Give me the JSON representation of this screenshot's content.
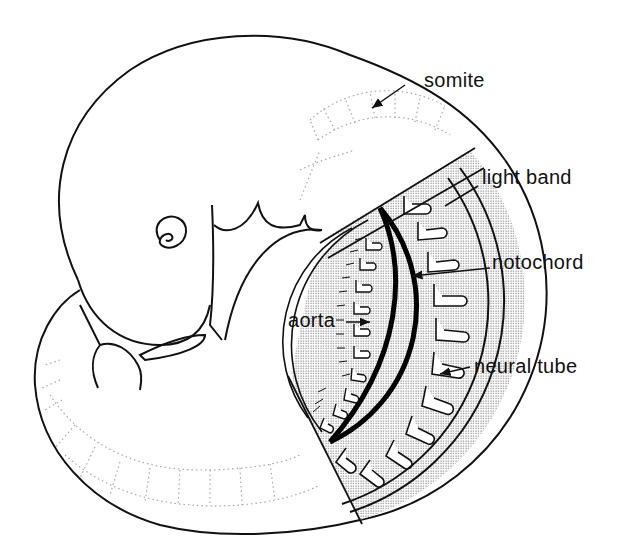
{
  "figure": {
    "colors": {
      "ink": "#111111",
      "stipple": "#9a9a9a",
      "shade": "#cfcfcf",
      "background": "#ffffff"
    }
  },
  "labels": {
    "somite": "somite",
    "light_band": "light band",
    "notochord": "notochord",
    "aorta": "aorta",
    "neural_tube": "neural tube"
  }
}
